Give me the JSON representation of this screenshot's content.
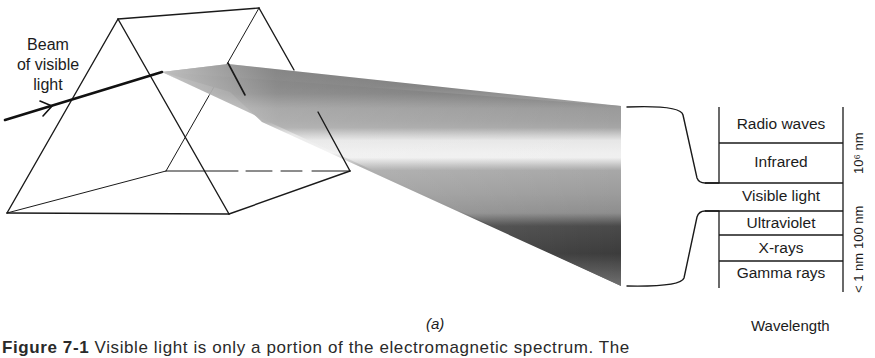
{
  "diagram": {
    "title_partial": "Figure 7-1",
    "caption_partial": "Visible light is only a portion of the electromagnetic spectrum. The",
    "panel_label": "(a)",
    "beam_label": [
      "Beam",
      "of visible",
      "light"
    ],
    "spectrum_table": {
      "bands": [
        {
          "label": "Radio waves"
        },
        {
          "label": "Infrared"
        },
        {
          "label": "Visible light"
        },
        {
          "label": "Ultraviolet"
        },
        {
          "label": "X-rays"
        },
        {
          "label": "Gamma rays"
        }
      ],
      "scale_labels": {
        "top": "10⁶ nm",
        "middle": "100 nm",
        "bottom": "< 1 nm"
      },
      "axis_label": "Wavelength"
    },
    "colors": {
      "line": "#1a1a1a",
      "band_dark": "#3a3a3a",
      "band_mid": "#8a8a8a",
      "band_light": "#e8e8e8"
    }
  }
}
